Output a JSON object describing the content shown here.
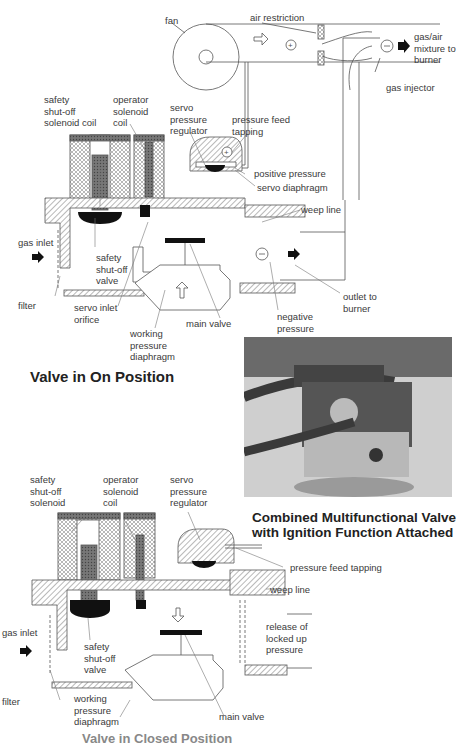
{
  "top_diagram": {
    "labels": {
      "fan": "fan",
      "air_restriction": "air restriction",
      "gas_air_mixture": "gas/air\nmixture to\nburner",
      "gas_injector": "gas injector",
      "safety_coil": "safety\nshut-off\nsolenoid coil",
      "operator_coil": "operator\nsolenoid\ncoil",
      "servo_regulator": "servo\npressure\nregulator",
      "pressure_feed": "pressure feed\ntapping",
      "positive_pressure": "positive pressure",
      "servo_diaphragm": "servo diaphragm",
      "weep_line": "weep line",
      "gas_inlet": "gas inlet",
      "filter": "filter",
      "safety_valve": "safety\nshut-off\nvalve",
      "servo_inlet": "servo inlet\norifice",
      "working_diaphragm": "working\npressure\ndiaphragm",
      "main_valve": "main valve",
      "negative_pressure": "negative\npressure",
      "outlet": "outlet to\nburner"
    },
    "caption": "Valve in On Position"
  },
  "photo": {
    "caption": "Combined Multifunctional Valve\nwith Ignition Function Attached"
  },
  "bottom_diagram": {
    "labels": {
      "safety_solenoid": "safety\nshut-off\nsolenoid",
      "operator_coil": "operator\nsolenoid\ncoil",
      "servo_regulator": "servo\npressure\nregulator",
      "pressure_feed": "pressure feed tapping",
      "weep_line": "weep line",
      "release": "release of\nlocked up\npressure",
      "gas_inlet": "gas inlet",
      "filter": "filter",
      "safety_valve": "safety\nshut-off\nvalve",
      "working_diaphragm": "working\npressure\ndiaphragm",
      "main_valve": "main valve"
    },
    "caption": "Valve in Closed Position"
  },
  "colors": {
    "line": "#555555",
    "hatch": "#9a9a9a",
    "dark": "#111111"
  }
}
